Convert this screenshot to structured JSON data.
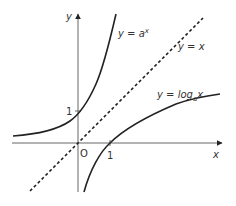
{
  "diagram": {
    "axes": {
      "x_label": "x",
      "y_label": "y",
      "origin_label": "O",
      "x_tick_label": "1",
      "y_tick_label": "1"
    },
    "curves": [
      {
        "name": "exponential",
        "label_prefix": "y = a",
        "label_sup": "x"
      },
      {
        "name": "line",
        "label": "y = x"
      },
      {
        "name": "logarithm",
        "label_prefix": "y = log",
        "label_sub": "a",
        "label_suffix": "x"
      }
    ],
    "colors": {
      "curve": "#222222",
      "axis": "#555555",
      "text": "#333333"
    }
  }
}
